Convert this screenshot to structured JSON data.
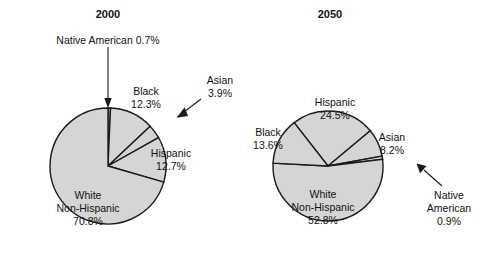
{
  "figure": {
    "background_color": "#ffffff",
    "slice_fill_color": "#d5d5d5",
    "slice_stroke_color": "#1a1a1a",
    "text_color": "#111111"
  },
  "chart_data": [
    {
      "type": "pie",
      "title": "2000",
      "categories": [
        "Native American",
        "Black",
        "Asian",
        "Hispanic",
        "White Non-Hispanic"
      ],
      "values": [
        0.7,
        12.3,
        3.9,
        12.7,
        70.8
      ],
      "value_unit": "%",
      "labels": [
        {
          "name": "Native American",
          "value": "0.7%",
          "text_line1": "Native American 0.7%",
          "text_line2": "",
          "callout": true
        },
        {
          "name": "Black",
          "value": "12.3%",
          "text_line1": "Black",
          "text_line2": "12.3%",
          "callout": false
        },
        {
          "name": "Asian",
          "value": "3.9%",
          "text_line1": "Asian",
          "text_line2": "3.9%",
          "callout": true
        },
        {
          "name": "Hispanic",
          "value": "12.7%",
          "text_line1": "Hispanic",
          "text_line2": "12.7%",
          "callout": false
        },
        {
          "name": "White Non-Hispanic",
          "value": "70.8%",
          "text_line1": "White",
          "text_line2": "Non-Hispanic",
          "text_line3": "70.8%",
          "callout": false
        }
      ],
      "legend": "none",
      "grid": false
    },
    {
      "type": "pie",
      "title": "2050",
      "categories": [
        "Hispanic",
        "Asian",
        "Native American",
        "White Non-Hispanic",
        "Black"
      ],
      "values": [
        24.5,
        8.2,
        0.9,
        52.8,
        13.6
      ],
      "value_unit": "%",
      "labels": [
        {
          "name": "Hispanic",
          "value": "24.5%",
          "text_line1": "Hispanic",
          "text_line2": "24.5%",
          "callout": false
        },
        {
          "name": "Asian",
          "value": "8.2%",
          "text_line1": "Asian",
          "text_line2": "8.2%",
          "callout": false
        },
        {
          "name": "Native American",
          "value": "0.9%",
          "text_line1": "Native",
          "text_line2": "American",
          "text_line3": "0.9%",
          "callout": true
        },
        {
          "name": "White Non-Hispanic",
          "value": "52.8%",
          "text_line1": "White",
          "text_line2": "Non-Hispanic",
          "text_line3": "52.8%",
          "callout": false
        },
        {
          "name": "Black",
          "value": "13.6%",
          "text_line1": "Black",
          "text_line2": "13.6%",
          "callout": false
        }
      ],
      "legend": "none",
      "grid": false
    }
  ],
  "left_chart": {
    "title": "2000",
    "native_american_callout": "Native American 0.7%",
    "black_l1": "Black",
    "black_l2": "12.3%",
    "asian_l1": "Asian",
    "asian_l2": "3.9%",
    "hispanic_l1": "Hispanic",
    "hispanic_l2": "12.7%",
    "white_l1": "White",
    "white_l2": "Non-Hispanic",
    "white_l3": "70.8%"
  },
  "right_chart": {
    "title": "2050",
    "hispanic_l1": "Hispanic",
    "hispanic_l2": "24.5%",
    "black_l1": "Black",
    "black_l2": "13.6%",
    "asian_l1": "Asian",
    "asian_l2": "8.2%",
    "white_l1": "White",
    "white_l2": "Non-Hispanic",
    "white_l3": "52.8%",
    "native_l1": "Native",
    "native_l2": "American",
    "native_l3": "0.9%"
  }
}
